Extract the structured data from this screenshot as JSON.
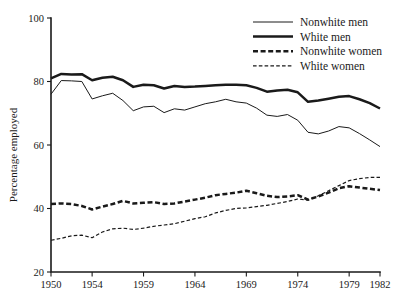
{
  "chart_data": {
    "type": "line",
    "title": "",
    "subtitle": "",
    "xlabel": "",
    "ylabel": "Percentage employed",
    "xlim": [
      1950,
      1982
    ],
    "ylim": [
      20,
      100
    ],
    "yticks": [
      20,
      40,
      60,
      80,
      100
    ],
    "ytick_labels": [
      "20",
      "40",
      "60",
      "80",
      "100"
    ],
    "xticks": [
      1950,
      1954,
      1959,
      1964,
      1969,
      1974,
      1979,
      1982
    ],
    "xtick_labels": [
      "1950",
      "1954",
      "1959",
      "1964",
      "1969",
      "1974",
      "1979",
      "1982"
    ],
    "grid": false,
    "legend_position": "top-right",
    "x": [
      1950,
      1951,
      1952,
      1953,
      1954,
      1955,
      1956,
      1957,
      1958,
      1959,
      1960,
      1961,
      1962,
      1963,
      1964,
      1965,
      1966,
      1967,
      1968,
      1969,
      1970,
      1971,
      1972,
      1973,
      1974,
      1975,
      1976,
      1977,
      1978,
      1979,
      1980,
      1981,
      1982
    ],
    "series": [
      {
        "name": "Nonwhite men",
        "style": "solid-thin",
        "color": "#1a1a1a",
        "values": [
          76.0,
          80.3,
          80.2,
          80.0,
          74.5,
          75.5,
          76.3,
          74.0,
          70.8,
          72.0,
          72.2,
          70.2,
          71.4,
          71.0,
          72.0,
          73.0,
          73.6,
          74.4,
          73.6,
          73.2,
          71.6,
          69.4,
          69.0,
          69.6,
          67.8,
          64.0,
          63.5,
          64.4,
          65.8,
          65.4,
          63.6,
          61.6,
          59.5
        ]
      },
      {
        "name": "White men",
        "style": "solid-thick",
        "color": "#1a1a1a",
        "values": [
          81.0,
          82.4,
          82.2,
          82.3,
          80.4,
          81.2,
          81.5,
          80.4,
          78.3,
          79.0,
          78.8,
          77.8,
          78.6,
          78.3,
          78.4,
          78.6,
          78.8,
          79.0,
          79.0,
          78.8,
          78.0,
          76.8,
          77.2,
          77.4,
          76.6,
          73.6,
          74.0,
          74.6,
          75.2,
          75.4,
          74.4,
          73.2,
          71.5
        ]
      },
      {
        "name": "Nonwhite women",
        "style": "dashed-thick",
        "color": "#1a1a1a",
        "values": [
          41.4,
          41.6,
          41.4,
          40.8,
          39.7,
          40.6,
          41.4,
          42.4,
          41.6,
          41.8,
          42.0,
          41.4,
          41.6,
          42.2,
          42.8,
          43.4,
          44.2,
          44.6,
          45.0,
          45.6,
          44.8,
          44.0,
          43.6,
          43.8,
          44.2,
          42.8,
          43.8,
          45.0,
          46.4,
          47.0,
          46.6,
          46.2,
          45.8
        ]
      },
      {
        "name": "White women",
        "style": "dashed-thin",
        "color": "#1a1a1a",
        "values": [
          30.0,
          30.6,
          31.4,
          31.6,
          30.8,
          32.6,
          33.6,
          33.8,
          33.4,
          33.8,
          34.4,
          34.8,
          35.2,
          36.0,
          36.8,
          37.4,
          38.6,
          39.4,
          40.0,
          40.2,
          40.6,
          41.0,
          41.6,
          42.2,
          43.0,
          42.6,
          44.0,
          45.6,
          47.2,
          48.8,
          49.4,
          49.8,
          49.8
        ]
      }
    ],
    "legend": [
      {
        "label": "Nonwhite men",
        "style": "solid-thin"
      },
      {
        "label": "White men",
        "style": "solid-thick"
      },
      {
        "label": "Nonwhite women",
        "style": "dashed-thick"
      },
      {
        "label": "White women",
        "style": "dashed-thin"
      }
    ]
  }
}
